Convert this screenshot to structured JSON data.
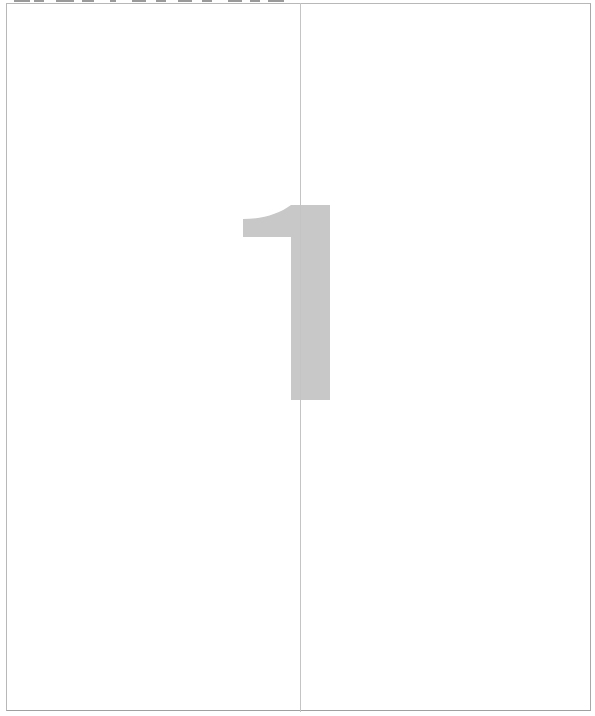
{
  "page": {
    "numeral": "1",
    "colors": {
      "background": "#ffffff",
      "frame_border": "#b8b8b8",
      "divider": "#c4c4c4",
      "numeral_fill": "#c8c8c8"
    }
  }
}
